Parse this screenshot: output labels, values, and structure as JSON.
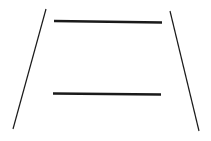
{
  "diagram": {
    "background": "#ffffff",
    "stroke_color": "#1a1a1a",
    "converging_lines": [
      {
        "name": "left-rail",
        "x1": 46,
        "y1": 9,
        "x2": 13,
        "y2": 129,
        "width": 1.2
      },
      {
        "name": "right-rail",
        "x1": 170,
        "y1": 11,
        "x2": 199,
        "y2": 131,
        "width": 1.2
      }
    ],
    "horizontal_bars": [
      {
        "name": "top-bar",
        "x1": 54,
        "y1": 21,
        "x2": 162,
        "y2": 22.5,
        "width": 2.4
      },
      {
        "name": "bottom-bar",
        "x1": 53,
        "y1": 93.5,
        "x2": 161,
        "y2": 94.5,
        "width": 2.4
      }
    ]
  }
}
